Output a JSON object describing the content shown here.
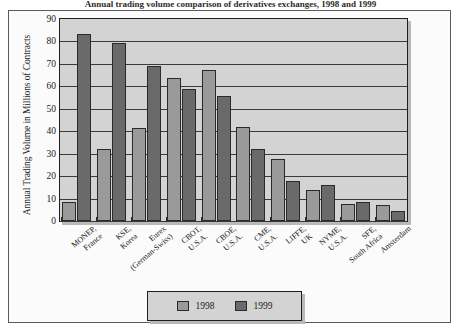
{
  "figure": {
    "title": "Annual trading volume comparison of derivatives exchanges, 1998 and 1999"
  },
  "legend_box": {
    "position": "bottom-center",
    "entries": [
      {
        "label": "1998",
        "color": "#9a9a9a"
      },
      {
        "label": "1999",
        "color": "#6a6a6a"
      }
    ]
  },
  "chart_data": {
    "type": "bar",
    "title": "Annual trading volume comparison of derivatives exchanges, 1998 and 1999",
    "xlabel": "",
    "ylabel": "Annual Trading Volume in Millions of Contracts",
    "ylim": [
      0,
      90
    ],
    "ytick_step": 10,
    "yticks": [
      90,
      80,
      70,
      60,
      50,
      40,
      30,
      20,
      10,
      0
    ],
    "grid": true,
    "legend_position": "bottom-center",
    "categories": [
      "MONEP, France",
      "KSE, Korea",
      "Eurex (German-Swiss)",
      "CBOT, U.S.A.",
      "CBOE, U.S.A.",
      "CME, U.S.A.",
      "LIFFE, UK",
      "NYME, U.S.A.",
      "SFE, South Africa",
      "Amsterdam"
    ],
    "category_lines": [
      [
        "MONEP,",
        "France"
      ],
      [
        "KSE,",
        "Korea"
      ],
      [
        "Eurex",
        "(German-Swiss)"
      ],
      [
        "CBOT,",
        "U.S.A."
      ],
      [
        "CBOE,",
        "U.S.A."
      ],
      [
        "CME,",
        "U.S.A."
      ],
      [
        "LIFFE,",
        "UK"
      ],
      [
        "NYME,",
        "U.S.A."
      ],
      [
        "SFE,",
        "South Africa"
      ],
      [
        "Amsterdam",
        ""
      ]
    ],
    "series": [
      {
        "name": "1998",
        "color": "#9a9a9a",
        "values": [
          8.5,
          32,
          41.5,
          63.5,
          67.5,
          42,
          27.5,
          14,
          7.5,
          7
        ]
      },
      {
        "name": "1999",
        "color": "#6a6a6a",
        "values": [
          83.5,
          79.5,
          69,
          59,
          55.5,
          32,
          18,
          16,
          8.5,
          4.5
        ]
      }
    ]
  },
  "colors": {
    "plot_background": "#d3d3d3",
    "figure_background": "#fbfbfb",
    "axis": "#1f1f1f",
    "series_1998": "#9a9a9a",
    "series_1999": "#6a6a6a"
  }
}
